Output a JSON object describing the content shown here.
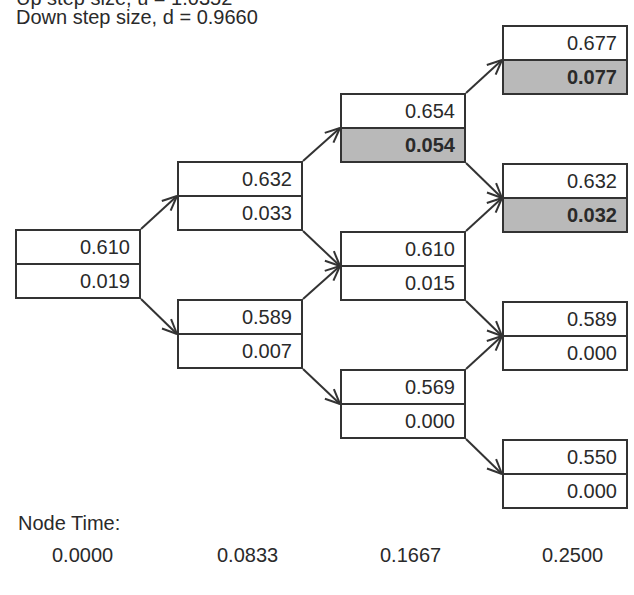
{
  "header": {
    "clipped_line": "Up step size, u = 1.0352",
    "down_step": "Down step size, d = 0.9660"
  },
  "colors": {
    "line": "#333333",
    "shade": "#b9b9b9",
    "text": "#2a2a2a"
  },
  "nodes": [
    {
      "id": "n0",
      "col": 0,
      "x": 15,
      "y": 229,
      "top": "0.610",
      "bottom": "0.019",
      "shaded": false
    },
    {
      "id": "n1u",
      "col": 1,
      "x": 177,
      "y": 161,
      "top": "0.632",
      "bottom": "0.033",
      "shaded": false
    },
    {
      "id": "n1d",
      "col": 1,
      "x": 177,
      "y": 299,
      "top": "0.589",
      "bottom": "0.007",
      "shaded": false
    },
    {
      "id": "n2uu",
      "col": 2,
      "x": 340,
      "y": 93,
      "top": "0.654",
      "bottom": "0.054",
      "shaded": true
    },
    {
      "id": "n2ud",
      "col": 2,
      "x": 340,
      "y": 231,
      "top": "0.610",
      "bottom": "0.015",
      "shaded": false
    },
    {
      "id": "n2dd",
      "col": 2,
      "x": 340,
      "y": 369,
      "top": "0.569",
      "bottom": "0.000",
      "shaded": false
    },
    {
      "id": "n3a",
      "col": 3,
      "x": 502,
      "y": 25,
      "top": "0.677",
      "bottom": "0.077",
      "shaded": true
    },
    {
      "id": "n3b",
      "col": 3,
      "x": 502,
      "y": 163,
      "top": "0.632",
      "bottom": "0.032",
      "shaded": true
    },
    {
      "id": "n3c",
      "col": 3,
      "x": 502,
      "y": 301,
      "top": "0.589",
      "bottom": "0.000",
      "shaded": false
    },
    {
      "id": "n3d",
      "col": 3,
      "x": 502,
      "y": 439,
      "top": "0.550",
      "bottom": "0.000",
      "shaded": false
    }
  ],
  "edges": [
    [
      "n0",
      "n1u",
      "up"
    ],
    [
      "n0",
      "n1d",
      "down"
    ],
    [
      "n1u",
      "n2uu",
      "up"
    ],
    [
      "n1u",
      "n2ud",
      "down"
    ],
    [
      "n1d",
      "n2ud",
      "up"
    ],
    [
      "n1d",
      "n2dd",
      "down"
    ],
    [
      "n2uu",
      "n3a",
      "up"
    ],
    [
      "n2uu",
      "n3b",
      "down"
    ],
    [
      "n2ud",
      "n3b",
      "up"
    ],
    [
      "n2ud",
      "n3c",
      "down"
    ],
    [
      "n2dd",
      "n3c",
      "up"
    ],
    [
      "n2dd",
      "n3d",
      "down"
    ]
  ],
  "footer": {
    "label": "Node Time:",
    "times": [
      "0.0000",
      "0.0833",
      "0.1667",
      "0.2500"
    ]
  }
}
